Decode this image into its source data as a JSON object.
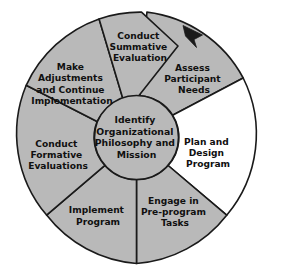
{
  "diagram": {
    "colors": {
      "wedge_fill_gray": "#b9b9b9",
      "wedge_fill_white": "#ffffff",
      "hub_fill": "#b9b9b9",
      "outline": "#1a1a1a",
      "text": "#101010",
      "background": "#ffffff"
    },
    "hub": {
      "lines": [
        "Identify",
        "Organizational",
        "Philosophy and",
        "Mission"
      ]
    },
    "flow_direction": "clockwise",
    "arrow": {
      "name": "clockwise-flow-arrow",
      "at_step": "Assess Participant Needs"
    },
    "steps": [
      {
        "id": "assess-participant-needs",
        "lines": [
          "Assess",
          "Participant",
          "Needs"
        ],
        "fill": "gray",
        "label_x": 194,
        "label_y": 79
      },
      {
        "id": "plan-and-design-program",
        "lines": [
          "Plan and",
          "Design",
          "Program"
        ],
        "fill": "white",
        "label_x": 208,
        "label_y": 153
      },
      {
        "id": "engage-in-pre-program-tasks",
        "lines": [
          "Engage in",
          "Pre-program",
          "Tasks"
        ],
        "fill": "gray",
        "label_x": 175,
        "label_y": 212
      },
      {
        "id": "implement-program",
        "lines": [
          "Implement",
          "Program"
        ],
        "fill": "gray",
        "label_x": 98,
        "label_y": 216
      },
      {
        "id": "conduct-formative-evaluations",
        "lines": [
          "Conduct",
          "Formative",
          "Evaluations"
        ],
        "fill": "gray",
        "label_x": 58,
        "label_y": 155
      },
      {
        "id": "make-adjustments-and-continue-implementation",
        "lines": [
          "Make",
          "Adjustments",
          "and Continue",
          "Implementation"
        ],
        "fill": "gray",
        "label_x": 72,
        "label_y": 84
      },
      {
        "id": "conduct-summative-evaluation",
        "lines": [
          "Conduct",
          "Summative",
          "Evaluation"
        ],
        "fill": "gray",
        "label_x": 140,
        "label_y": 47
      }
    ]
  }
}
